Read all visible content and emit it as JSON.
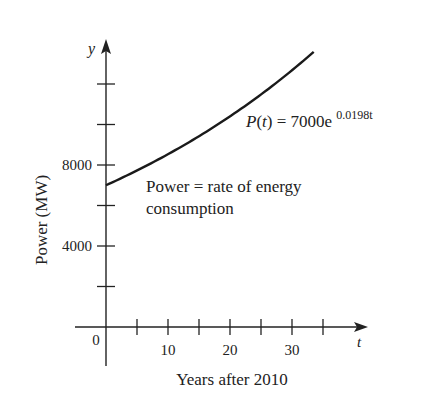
{
  "chart_data": {
    "type": "line",
    "title": "",
    "xlabel": "Years after 2010",
    "ylabel": "Power (MW)",
    "x_axis_symbol": "t",
    "y_axis_symbol": "y",
    "xlim": [
      0,
      42
    ],
    "ylim": [
      0,
      16000
    ],
    "x_ticks": [
      5,
      10,
      15,
      20,
      25,
      30,
      35
    ],
    "x_tick_labels": [
      {
        "value": 0,
        "label": "0"
      },
      {
        "value": 10,
        "label": "10"
      },
      {
        "value": 20,
        "label": "20"
      },
      {
        "value": 30,
        "label": "30"
      }
    ],
    "y_ticks": [
      2000,
      4000,
      6000,
      8000,
      10000,
      12000
    ],
    "y_tick_labels": [
      {
        "value": 4000,
        "label": "4000"
      },
      {
        "value": 8000,
        "label": "8000"
      }
    ],
    "grid": false,
    "series": [
      {
        "name": "P(t)",
        "function": "7000*exp(0.0198*t)",
        "a": 7000,
        "k": 0.0198,
        "t_range": [
          0,
          33.5
        ],
        "x": [
          0,
          5,
          10,
          15,
          20,
          25,
          30,
          33.5
        ],
        "values": [
          7000,
          7729,
          8532,
          9420,
          10400,
          11482,
          12676,
          13582
        ]
      }
    ],
    "annotations": [
      {
        "text_main": "P(t) = 7000e",
        "text_sup": "0.0198t"
      },
      {
        "line1": "Power = rate of energy",
        "line2": "consumption"
      }
    ]
  }
}
